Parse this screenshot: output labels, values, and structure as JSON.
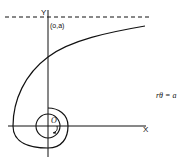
{
  "diagram": {
    "type": "hyperbolic-spiral",
    "labels": {
      "y_axis": "Y",
      "x_axis": "X",
      "origin": "O",
      "asymptote_point": "(o,a)",
      "equation": "rθ = a"
    },
    "colors": {
      "stroke": "#111111",
      "background": "#ffffff"
    }
  }
}
